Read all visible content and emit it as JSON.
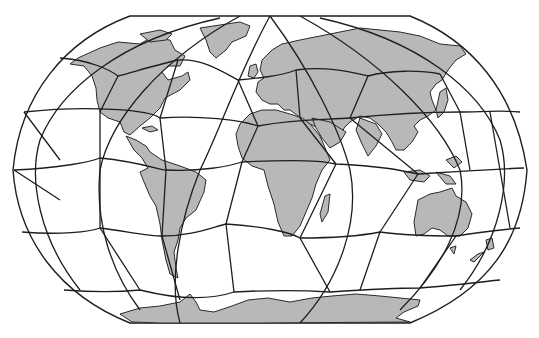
{
  "map": {
    "projection": "robinson-like",
    "overlay": "geodesic polygon grid",
    "colors": {
      "background": "#ffffff",
      "land": "#b8b8b8",
      "coastline": "#2a2a2a",
      "grid": "#1e1e1e"
    },
    "continents": [
      "North America",
      "South America",
      "Greenland",
      "Europe",
      "Africa",
      "Asia",
      "Australia",
      "Antarctica",
      "New Zealand"
    ]
  }
}
